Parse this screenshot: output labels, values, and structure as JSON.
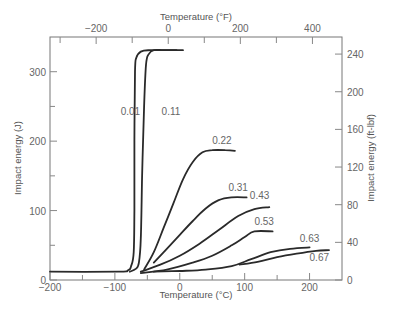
{
  "chart_data": {
    "type": "line",
    "title": "",
    "xlabel": "Temperature (°C)",
    "ylabel": "Impact energy (J)",
    "x2label": "Temperature (°F)",
    "y2label": "Impact energy (ft-lbf)",
    "xlim": [
      -200,
      250
    ],
    "ylim": [
      0,
      350
    ],
    "x2lim": [
      -328,
      482
    ],
    "y2lim": [
      0,
      258
    ],
    "xticks": [
      -200,
      -100,
      0,
      100,
      200
    ],
    "xticks_minor": [
      -150,
      -50,
      50,
      150
    ],
    "yticks": [
      0,
      100,
      200,
      300
    ],
    "yticks_minor": [
      50,
      150,
      250
    ],
    "x2ticks": [
      -200,
      0,
      200,
      400
    ],
    "x2ticks_minor": [
      -300,
      -100,
      100,
      300
    ],
    "y2ticks": [
      0,
      40,
      80,
      120,
      160,
      200,
      240
    ],
    "grid": false,
    "legend": "inline curve labels (wt% C)",
    "series": [
      {
        "name": "0.01",
        "x": [
          -200,
          -95,
          -80,
          -75,
          -71,
          -70,
          -70,
          -69,
          -67,
          -60,
          -45,
          5
        ],
        "y": [
          12,
          12,
          14,
          20,
          40,
          100,
          200,
          300,
          320,
          329,
          331,
          331
        ]
      },
      {
        "name": "0.11",
        "x": [
          -77,
          -68,
          -63,
          -60,
          -58,
          -55,
          -52,
          -48,
          -40,
          -25,
          -5
        ],
        "y": [
          12,
          16,
          25,
          60,
          150,
          250,
          310,
          325,
          331,
          331,
          331
        ]
      },
      {
        "name": "0.22",
        "x": [
          -55,
          -40,
          -25,
          -10,
          5,
          20,
          35,
          50,
          70,
          85
        ],
        "y": [
          15,
          40,
          75,
          110,
          145,
          170,
          184,
          187,
          187,
          186
        ]
      },
      {
        "name": "0.31",
        "x": [
          -40,
          -20,
          0,
          20,
          40,
          60,
          80,
          103
        ],
        "y": [
          25,
          45,
          65,
          85,
          103,
          115,
          119,
          119
        ]
      },
      {
        "name": "0.43",
        "x": [
          -60,
          -30,
          0,
          30,
          60,
          90,
          115,
          138
        ],
        "y": [
          12,
          22,
          35,
          52,
          72,
          92,
          102,
          105
        ]
      },
      {
        "name": "0.53",
        "x": [
          -60,
          -20,
          20,
          50,
          80,
          100,
          115,
          143
        ],
        "y": [
          10,
          15,
          25,
          35,
          50,
          62,
          70,
          70
        ]
      },
      {
        "name": "0.63",
        "x": [
          -40,
          0,
          40,
          80,
          110,
          140,
          170,
          200
        ],
        "y": [
          12,
          13,
          15,
          20,
          30,
          40,
          45,
          47
        ]
      },
      {
        "name": "0.67",
        "x": [
          92,
          120,
          150,
          180,
          210,
          230
        ],
        "y": [
          22,
          26,
          33,
          38,
          42,
          43
        ]
      }
    ],
    "annotations": [
      {
        "text": "0.01",
        "x": -91,
        "y": 237
      },
      {
        "text": "0.11",
        "x": -28,
        "y": 237
      },
      {
        "text": "0.22",
        "x": 50,
        "y": 196
      },
      {
        "text": "0.31",
        "x": 75,
        "y": 128
      },
      {
        "text": "0.43",
        "x": 108,
        "y": 117
      },
      {
        "text": "0.53",
        "x": 115,
        "y": 79
      },
      {
        "text": "0.63",
        "x": 185,
        "y": 55
      },
      {
        "text": "0.67",
        "x": 200,
        "y": 28
      }
    ]
  }
}
